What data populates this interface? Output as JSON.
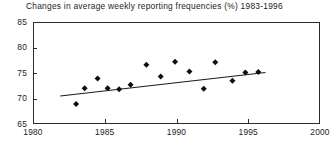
{
  "chart_data": {
    "type": "scatter",
    "title": "Changes in average weekly reporting frequencies (%) 1983-1996",
    "xlabel": "",
    "ylabel": "",
    "xlim": [
      1980,
      2000
    ],
    "ylim": [
      65,
      85
    ],
    "xticks": [
      1980,
      1985,
      1990,
      1995,
      2000
    ],
    "yticks": [
      65,
      70,
      75,
      80,
      85
    ],
    "grid": false,
    "legend": null,
    "marker": "diamond",
    "series": [
      {
        "name": "Average weekly reporting frequency",
        "points": [
          {
            "x": 1983.0,
            "y": 68.9
          },
          {
            "x": 1983.6,
            "y": 72.0
          },
          {
            "x": 1984.5,
            "y": 73.9
          },
          {
            "x": 1985.2,
            "y": 72.0
          },
          {
            "x": 1986.0,
            "y": 71.8
          },
          {
            "x": 1986.8,
            "y": 72.7
          },
          {
            "x": 1987.9,
            "y": 76.6
          },
          {
            "x": 1988.9,
            "y": 74.3
          },
          {
            "x": 1989.9,
            "y": 77.2
          },
          {
            "x": 1990.9,
            "y": 75.3
          },
          {
            "x": 1991.9,
            "y": 71.9
          },
          {
            "x": 1992.7,
            "y": 77.1
          },
          {
            "x": 1993.9,
            "y": 73.5
          },
          {
            "x": 1994.8,
            "y": 75.1
          },
          {
            "x": 1995.7,
            "y": 75.2
          }
        ]
      }
    ],
    "trendline": {
      "type": "linear-fit",
      "x_start": 1981.9,
      "y_start": 70.5,
      "x_end": 1996.2,
      "y_end": 75.1
    }
  }
}
